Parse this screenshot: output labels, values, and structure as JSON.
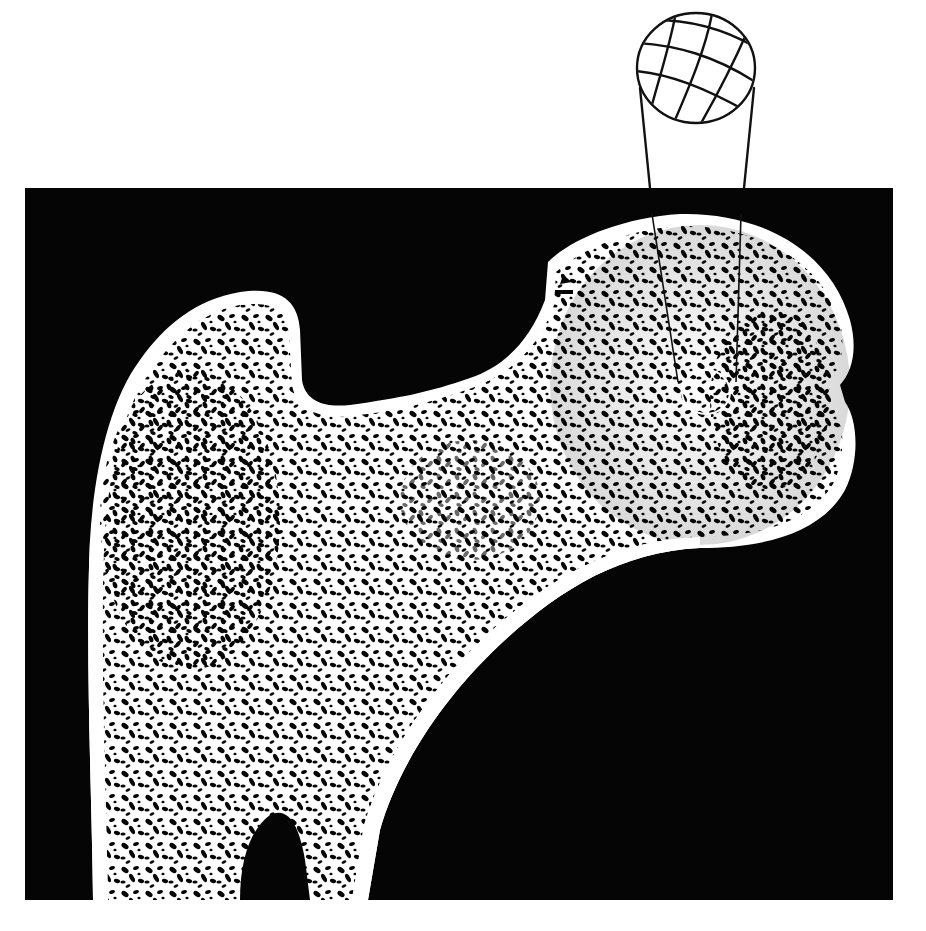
{
  "figure": {
    "background_color": "#ffffff",
    "panel": {
      "x": 25,
      "y": 188,
      "width": 868,
      "height": 712,
      "color": "#050505"
    },
    "bone_color": "#ffffff",
    "trabecula_void_color": "#050505",
    "regions": [
      {
        "name": "femoral-head",
        "cx": 700,
        "cy": 385,
        "rx": 155,
        "ry": 165
      },
      {
        "name": "greater-trochanter",
        "cx": 230,
        "cy": 380
      },
      {
        "name": "femoral-neck",
        "cx": 440,
        "cy": 440
      },
      {
        "name": "femoral-shaft",
        "cx": 240,
        "cy": 780
      }
    ],
    "core_sample": {
      "label": "spherical core sample",
      "sphere": {
        "cx": 696,
        "cy": 68,
        "rx": 60,
        "ry": 56
      },
      "line_color": "#111111",
      "stem_left": {
        "x1": 640,
        "y1": 88,
        "x2": 650,
        "y2": 188
      },
      "stem_right": {
        "x1": 754,
        "y1": 88,
        "x2": 744,
        "y2": 188
      },
      "inner_lines_in_head": [
        {
          "x1": 653,
          "y1": 215,
          "x2": 680,
          "y2": 380
        },
        {
          "x1": 740,
          "y1": 215,
          "x2": 735,
          "y2": 380
        }
      ],
      "inner_circle": {
        "cx": 706,
        "cy": 392,
        "r": 22
      }
    }
  }
}
